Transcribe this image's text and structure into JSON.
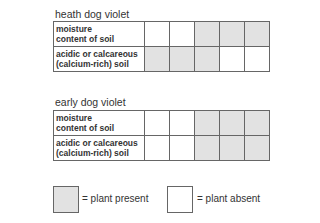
{
  "tables": [
    {
      "title": "heath dog violet",
      "rows": [
        {
          "label_line1": "moisture",
          "label_line2": "content of soil",
          "cells": [
            "absent",
            "absent",
            "present",
            "present",
            "present"
          ]
        },
        {
          "label_line1": "acidic or calcareous",
          "label_line2": "(calcium-rich) soil",
          "cells": [
            "present",
            "present",
            "present",
            "absent",
            "absent"
          ]
        }
      ]
    },
    {
      "title": "early dog violet",
      "rows": [
        {
          "label_line1": "moisture",
          "label_line2": "content of soil",
          "cells": [
            "absent",
            "absent",
            "present",
            "present",
            "present"
          ]
        },
        {
          "label_line1": "acidic or calcareous",
          "label_line2": "(calcium-rich) soil",
          "cells": [
            "absent",
            "absent",
            "present",
            "present",
            "present"
          ]
        }
      ]
    }
  ],
  "legend": {
    "present_label": "= plant present",
    "absent_label": "= plant absent"
  },
  "colors": {
    "present": "#e2e2e2",
    "absent": "#ffffff",
    "border": "#666666"
  }
}
